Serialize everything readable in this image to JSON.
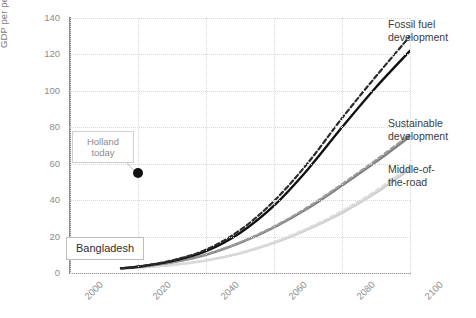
{
  "chart_data": {
    "type": "line",
    "title": "",
    "xlabel": "",
    "ylabel": "GDP per person, thousand 2011 $PPP",
    "xlim": [
      2000,
      2100
    ],
    "ylim": [
      0,
      140
    ],
    "xticks": [
      "2000",
      "2020",
      "2040",
      "2060",
      "2080",
      "2100"
    ],
    "yticks": [
      "0",
      "20",
      "40",
      "60",
      "80",
      "100",
      "120",
      "140"
    ],
    "grid": true,
    "legend_position": "right-inline",
    "x": [
      2015,
      2020,
      2030,
      2040,
      2050,
      2060,
      2070,
      2080,
      2090,
      2100
    ],
    "series": [
      {
        "name": "Fossil fuel development",
        "style": "solid",
        "color": "#111111",
        "values": [
          2.6,
          3.4,
          6.5,
          12.0,
          22.0,
          37.0,
          57.0,
          80.0,
          102.0,
          122.0
        ]
      },
      {
        "name": "Fossil fuel development (variant)",
        "style": "dashed",
        "color": "#2b2b2b",
        "values": [
          2.6,
          3.5,
          6.9,
          12.8,
          23.5,
          39.5,
          60.5,
          85.0,
          108.0,
          130.0
        ]
      },
      {
        "name": "Sustainable development",
        "style": "solid",
        "color": "#7d7d7d",
        "values": [
          2.6,
          3.3,
          5.8,
          10.0,
          16.5,
          25.0,
          35.5,
          48.0,
          61.0,
          75.0
        ]
      },
      {
        "name": "Sustainable development (variant)",
        "style": "dashed",
        "color": "#9a9a9a",
        "values": [
          2.6,
          3.3,
          5.9,
          10.2,
          16.8,
          25.5,
          36.2,
          48.8,
          62.0,
          76.0
        ]
      },
      {
        "name": "Middle-of-the-road",
        "style": "solid",
        "color": "#cfcfcf",
        "values": [
          2.6,
          3.0,
          4.4,
          6.8,
          10.8,
          16.5,
          24.0,
          33.0,
          44.0,
          57.0
        ]
      },
      {
        "name": "Middle-of-the-road (variant)",
        "style": "dashed",
        "color": "#dcdcdc",
        "values": [
          2.6,
          3.0,
          4.5,
          7.0,
          11.1,
          17.0,
          24.7,
          34.0,
          45.2,
          58.5
        ]
      }
    ],
    "annotations": [
      {
        "id": "holland-today",
        "label": "Holland\ntoday",
        "point": {
          "x": 2020,
          "y": 55
        },
        "marker": "filled-circle",
        "marker_color": "#111111"
      },
      {
        "id": "bangladesh",
        "label": "Bangladesh"
      }
    ],
    "series_labels": [
      {
        "id": "fossil-fuel",
        "text": "Fossil fuel\ndevelopment"
      },
      {
        "id": "sustainable",
        "text": "Sustainable\ndevelopment"
      },
      {
        "id": "middle-road",
        "text": "Middle-of-\nthe-road"
      }
    ]
  }
}
